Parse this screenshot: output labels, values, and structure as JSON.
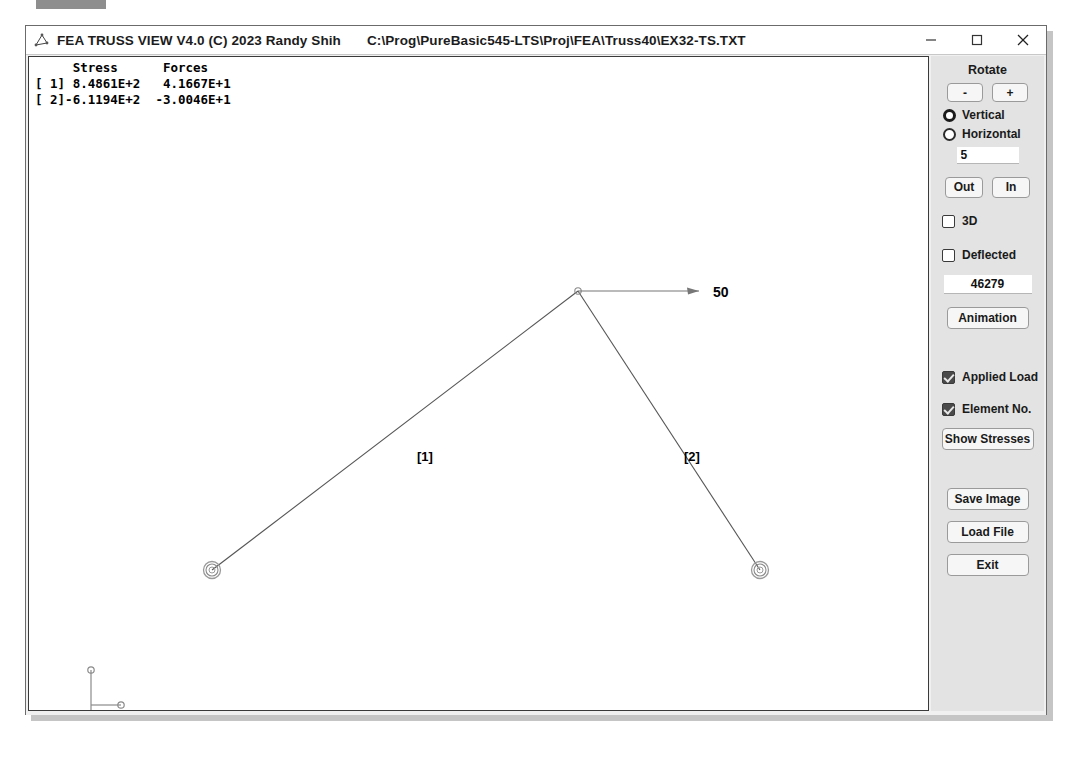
{
  "window": {
    "icon": "app-truss-icon",
    "title": "FEA TRUSS VIEW V4.0 (C) 2023 Randy Shih",
    "file_path": "C:\\Prog\\PureBasic545-LTS\\Proj\\FEA\\Truss40\\EX32-TS.TXT",
    "minimize": "minimize-icon",
    "maximize": "maximize-icon",
    "close": "close-icon"
  },
  "results": {
    "header": "     Stress      Forces",
    "rows": [
      "[ 1] 8.4861E+2   4.1667E+1",
      "[ 2]-6.1194E+2  -3.0046E+1"
    ],
    "text": "     Stress      Forces\n[ 1] 8.4861E+2   4.1667E+1\n[ 2]-6.1194E+2  -3.0046E+1"
  },
  "model": {
    "element_labels": [
      {
        "text": "[1]",
        "x": 388,
        "y": 392
      },
      {
        "text": "[2]",
        "x": 655,
        "y": 392
      }
    ],
    "load_label": "50",
    "nodes": [
      {
        "id": 1,
        "x": 183,
        "y": 513,
        "support": true
      },
      {
        "id": 2,
        "x": 549,
        "y": 234,
        "support": false
      },
      {
        "id": 3,
        "x": 731,
        "y": 513,
        "support": true
      }
    ],
    "elements": [
      {
        "id": 1,
        "from": 1,
        "to": 2
      },
      {
        "id": 2,
        "from": 2,
        "to": 3
      }
    ],
    "load_arrow": {
      "x1": 549,
      "y1": 234,
      "x2": 670,
      "y2": 234
    }
  },
  "panel": {
    "rotate_title": "Rotate",
    "rotate_minus": "-",
    "rotate_plus": "+",
    "radio_vertical": "Vertical",
    "radio_horizontal": "Horizontal",
    "rotate_step_value": "5",
    "zoom_out": "Out",
    "zoom_in": "In",
    "chk_3d": "3D",
    "chk_deflected": "Deflected",
    "scale_value": "46279",
    "animation": "Animation",
    "chk_applied_load": "Applied Load",
    "chk_element_no": "Element No.",
    "show_stresses": "Show Stresses",
    "save_image": "Save Image",
    "load_file": "Load File",
    "exit": "Exit",
    "accent": "#4a4a4a",
    "panel_bg": "#e3e3e3"
  }
}
